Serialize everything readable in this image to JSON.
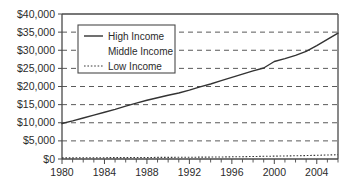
{
  "chart_data": {
    "type": "line",
    "title": "",
    "xlabel": "",
    "ylabel": "",
    "xlim": [
      1980,
      2006
    ],
    "ylim": [
      0,
      40000
    ],
    "grid": true,
    "legend_position": "upper-left-inside",
    "y_ticks": [
      0,
      5000,
      10000,
      15000,
      20000,
      25000,
      30000,
      35000,
      40000
    ],
    "y_tick_labels": [
      "$0",
      "$5,000",
      "$10,000",
      "$15,000",
      "$20,000",
      "$25,000",
      "$30,000",
      "$35,000",
      "$40,000"
    ],
    "x_ticks": [
      1980,
      1981,
      1982,
      1983,
      1984,
      1985,
      1986,
      1987,
      1988,
      1989,
      1990,
      1991,
      1992,
      1993,
      1994,
      1995,
      1996,
      1997,
      1998,
      1999,
      2000,
      2001,
      2002,
      2003,
      2004,
      2005,
      2006
    ],
    "x_tick_labels_major": [
      "1980",
      "1984",
      "1988",
      "1992",
      "1996",
      "2000",
      "2004"
    ],
    "x_ticks_major": [
      1980,
      1984,
      1988,
      1992,
      1996,
      2000,
      2004
    ],
    "x": [
      1980,
      1981,
      1982,
      1983,
      1984,
      1985,
      1986,
      1987,
      1988,
      1989,
      1990,
      1991,
      1992,
      1993,
      1994,
      1995,
      1996,
      1997,
      1998,
      1999,
      2000,
      2001,
      2002,
      2003,
      2004,
      2005,
      2006
    ],
    "series": [
      {
        "name": "High Income",
        "style": "solid",
        "color": "#333333",
        "values": [
          9800,
          10500,
          11300,
          12100,
          12900,
          13700,
          14600,
          15400,
          16200,
          16900,
          17600,
          18200,
          19000,
          19900,
          20700,
          21600,
          22500,
          23400,
          24300,
          25100,
          26900,
          27700,
          28600,
          29700,
          31300,
          33000,
          34700
        ]
      },
      {
        "name": "Middle Income",
        "style": "none",
        "color": "#8a8a8a",
        "values": [
          null,
          null,
          null,
          null,
          null,
          null,
          null,
          null,
          null,
          null,
          null,
          null,
          null,
          null,
          null,
          null,
          null,
          null,
          null,
          null,
          null,
          null,
          null,
          null,
          null,
          null,
          null
        ]
      },
      {
        "name": "Low Income",
        "style": "dotted",
        "color": "#3a3a3a",
        "values": [
          300,
          320,
          340,
          350,
          360,
          380,
          390,
          400,
          420,
          440,
          450,
          470,
          490,
          510,
          530,
          560,
          600,
          640,
          690,
          740,
          790,
          840,
          890,
          950,
          1020,
          1100,
          1180
        ]
      }
    ]
  },
  "legend": {
    "entries": [
      {
        "label": "High Income"
      },
      {
        "label": "Middle Income"
      },
      {
        "label": "Low Income"
      }
    ]
  }
}
